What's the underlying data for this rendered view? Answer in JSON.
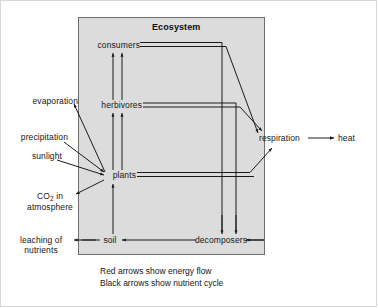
{
  "figure": {
    "title": "Ecosystem",
    "box_fill": "#dcdcdc",
    "box_stroke": "#6e6e6e",
    "arrow_color": "#1a1a1a",
    "caption": "Red arrows show energy flow\nBlack arrows show nutrient cycle",
    "caption_lines": [
      "Red arrows show energy flow",
      "Black arrows show nutrient cycle"
    ]
  },
  "nodes": {
    "consumers": "consumers",
    "herbivores": "herbivores",
    "plants": "plants",
    "soil": "soil",
    "decomposers": "decomposers",
    "respiration": "respiration",
    "heat": "heat",
    "evaporation": "evaporation",
    "precipitation": "precipitation",
    "sunlight": "sunlight",
    "co2_line1": "CO",
    "co2_sub": "2",
    "co2_line1b": " in",
    "co2_line2": "atmosphere",
    "leaching_line1": "leaching of",
    "leaching_line2": "nutrients"
  },
  "flows": {
    "energy": [
      "plants to herbivores",
      "herbivores to consumers",
      "plants to respiration",
      "herbivores to respiration",
      "consumers to respiration",
      "respiration to heat"
    ],
    "nutrient": [
      "soil to plants",
      "decomposers to soil",
      "soil to leaching of nutrients",
      "consumers to decomposers",
      "herbivores to decomposers",
      "plants to CO2 in atmosphere",
      "sunlight to plants",
      "precipitation to plants",
      "plants to evaporation"
    ]
  }
}
